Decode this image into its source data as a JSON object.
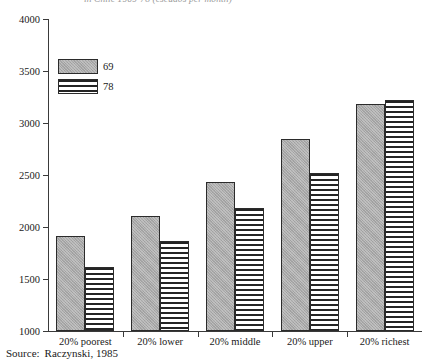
{
  "title_clipped": "in Chile 1969-78 (escudos per month)",
  "source": {
    "label": "Source:",
    "text": "Raczynski, 1985"
  },
  "legend": {
    "position": "upper-left-inside",
    "entries": [
      {
        "name": "69",
        "fill": "solid-gray-stipple",
        "color": "#a9a9a9"
      },
      {
        "name": "78",
        "fill": "horizontal-stripes",
        "color": "#242424"
      }
    ]
  },
  "chart_data": {
    "type": "bar",
    "title": "in Chile 1969-78 (escudos per month)",
    "xlabel": "",
    "ylabel": "",
    "ylim": [
      1000,
      4000
    ],
    "yticks": [
      1000,
      1500,
      2000,
      2500,
      3000,
      3500,
      4000
    ],
    "grid": false,
    "legend_position": "upper left",
    "categories": [
      "20% poorest",
      "20% lower",
      "20% middle",
      "20% upper",
      "20% richest"
    ],
    "series": [
      {
        "name": "69",
        "values": [
          1910,
          2110,
          2430,
          2850,
          3180
        ]
      },
      {
        "name": "78",
        "values": [
          1620,
          1870,
          2180,
          2520,
          3220
        ]
      }
    ]
  }
}
